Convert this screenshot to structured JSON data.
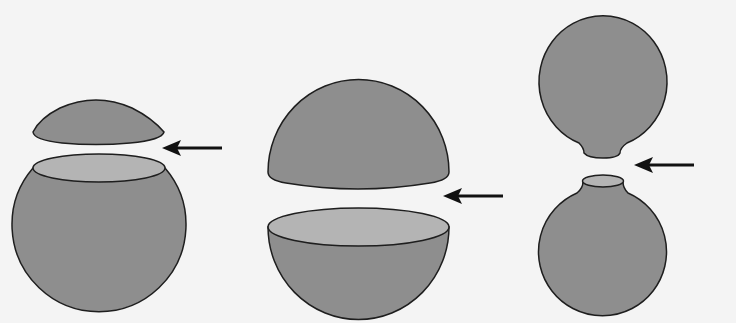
{
  "diagram": {
    "colors": {
      "background": "#f4f4f4",
      "solid_fill": "#8e8e8e",
      "cut_surface_fill": "#b4b4b4",
      "stroke": "#1e1e1e",
      "arrow": "#111111"
    },
    "figures": [
      {
        "id": "small-cap-cut",
        "label": "Sphere cut near top (small cap removed)"
      },
      {
        "id": "hemisphere-cut",
        "label": "Sphere cut through the middle (two hemispheres)"
      },
      {
        "id": "neck-cut",
        "label": "Constricted sphere pinched into two bulbs"
      }
    ],
    "arrows": [
      {
        "id": "arrow-1",
        "direction": "left"
      },
      {
        "id": "arrow-2",
        "direction": "left"
      },
      {
        "id": "arrow-3",
        "direction": "left"
      }
    ]
  }
}
